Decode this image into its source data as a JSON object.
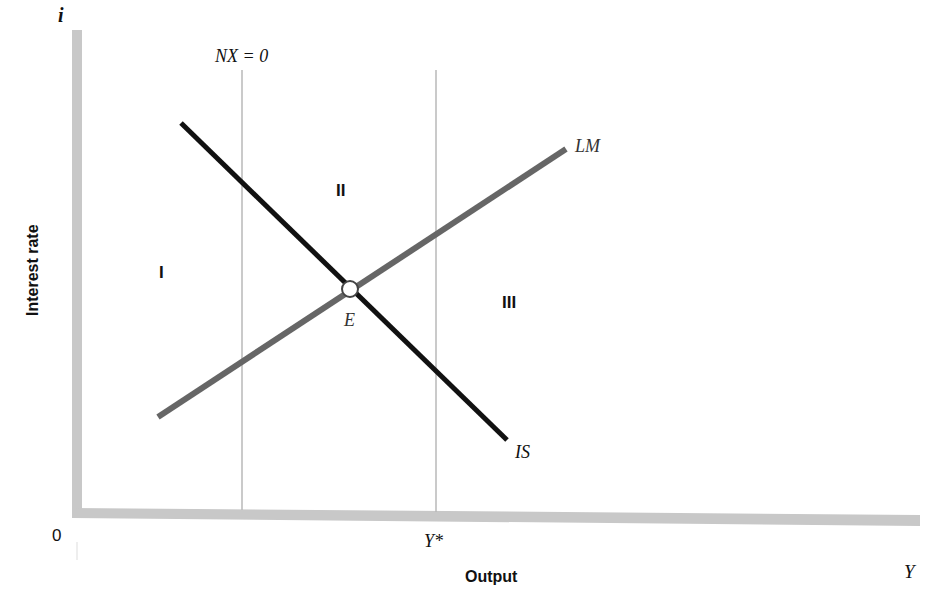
{
  "axes": {
    "y_label": "Interest rate",
    "y_symbol": "i",
    "x_label": "Output",
    "x_symbol": "Y",
    "origin": "0"
  },
  "reference_lines": {
    "nx_zero_label": "NX = 0",
    "full_employment_label": "Y*"
  },
  "curves": {
    "is_label": "IS",
    "lm_label": "LM"
  },
  "equilibrium": {
    "label": "E"
  },
  "regions": {
    "r1": "I",
    "r2": "II",
    "r3": "III"
  },
  "colors": {
    "axis": "#c8c8c8",
    "is_curve": "#111111",
    "lm_curve": "#666666",
    "ref_line": "#b8b8b8",
    "text": "#111111"
  }
}
